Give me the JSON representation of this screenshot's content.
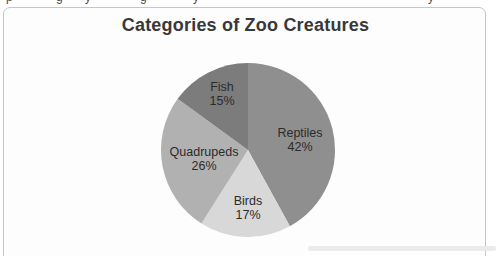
{
  "chart": {
    "title": "Categories of Zoo Creatures"
  },
  "chart_data": {
    "type": "pie",
    "title": "Categories of Zoo Creatures",
    "categories": [
      "Reptiles",
      "Birds",
      "Quadrupeds",
      "Fish"
    ],
    "values": [
      42,
      17,
      26,
      15
    ],
    "unit": "%",
    "start_angle_deg": 0,
    "direction": "clockwise",
    "labels_position": "inside",
    "legend": "none",
    "slices": [
      {
        "label": "Reptiles",
        "value": 42,
        "display": "42%",
        "color": "#8f8f8f"
      },
      {
        "label": "Birds",
        "value": 17,
        "display": "17%",
        "color": "#d8d8d8"
      },
      {
        "label": "Quadrupeds",
        "value": 26,
        "display": "26%",
        "color": "#b1b1b1"
      },
      {
        "label": "Fish",
        "value": 15,
        "display": "15%",
        "color": "#7c7c7c"
      }
    ],
    "label_color": "#2b2b2b",
    "frame_border_color": "#c6c6c6"
  },
  "artifacts": {
    "clipped_top_text_fragments": [
      "p",
      "g",
      "y",
      "g",
      "y",
      "y"
    ]
  }
}
